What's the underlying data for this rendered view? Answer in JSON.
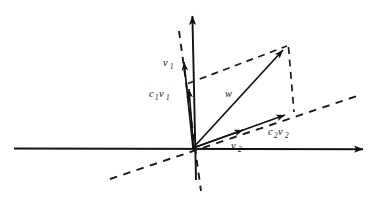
{
  "figure": {
    "background_color": "#ffffff",
    "stroke_color": "#121212",
    "width": 380,
    "height": 197
  },
  "axes": {
    "origin": {
      "x": 193,
      "y": 148
    },
    "x_axis": {
      "name": "horizontal-axis",
      "from": {
        "x": 14,
        "y": 148
      },
      "to": {
        "x": 371,
        "y": 149
      },
      "arrow": "end"
    },
    "y_axis": {
      "name": "vertical-axis",
      "from": {
        "x": 196,
        "y": 180
      },
      "to": {
        "x": 192,
        "y": 8
      },
      "arrow": "end"
    }
  },
  "dashed_lines": [
    {
      "name": "steep-dashed-subspace-line",
      "from": {
        "x": 179,
        "y": 31
      },
      "to": {
        "x": 201,
        "y": 191
      }
    },
    {
      "name": "shallow-dashed-subspace-line",
      "from": {
        "x": 110,
        "y": 179
      },
      "to": {
        "x": 357,
        "y": 96
      }
    },
    {
      "name": "dashed-projection-top",
      "from": {
        "x": 188,
        "y": 83
      },
      "to": {
        "x": 287,
        "y": 46
      }
    },
    {
      "name": "dashed-projection-right",
      "from": {
        "x": 288,
        "y": 46
      },
      "to": {
        "x": 294,
        "y": 112
      }
    }
  ],
  "vectors": [
    {
      "name": "vector-v1",
      "label": "v",
      "subscript": "1",
      "from": {
        "x": 193,
        "y": 148
      },
      "to": {
        "x": 183,
        "y": 55
      },
      "label_pos": {
        "x": 163,
        "y": 62
      }
    },
    {
      "name": "vector-c1v1",
      "label": "c",
      "subscript": "1",
      "label2": "v",
      "subscript2": "1",
      "from": {
        "x": 193,
        "y": 148
      },
      "to": {
        "x": 188,
        "y": 82
      },
      "label_pos": {
        "x": 150,
        "y": 93
      }
    },
    {
      "name": "vector-w",
      "label": "w",
      "subscript": "",
      "from": {
        "x": 193,
        "y": 148
      },
      "to": {
        "x": 288,
        "y": 45
      },
      "label_pos": {
        "x": 226,
        "y": 93
      }
    },
    {
      "name": "vector-v2",
      "label": "v",
      "subscript": "2",
      "from": {
        "x": 193,
        "y": 148
      },
      "to": {
        "x": 251,
        "y": 127
      },
      "label_pos": {
        "x": 232,
        "y": 145
      }
    },
    {
      "name": "vector-c2v2",
      "label": "c",
      "subscript": "2",
      "label2": "v",
      "subscript2": "2",
      "from": {
        "x": 193,
        "y": 148
      },
      "to": {
        "x": 293,
        "y": 112
      },
      "label_pos": {
        "x": 269,
        "y": 131
      }
    }
  ],
  "labels": {
    "v1": "v",
    "v1_sub": "1",
    "c1v1_c": "c",
    "c1v1_c_sub": "1",
    "c1v1_v": "v",
    "c1v1_v_sub": "1",
    "w": "w",
    "v2": "v",
    "v2_sub": "2",
    "c2v2_c": "c",
    "c2v2_c_sub": "2",
    "c2v2_v": "v",
    "c2v2_v_sub": "2"
  }
}
